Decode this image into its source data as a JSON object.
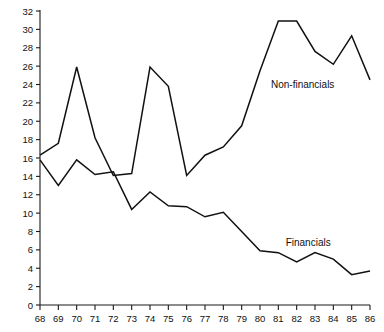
{
  "chart_data": {
    "type": "line",
    "title": "",
    "subtitle": "",
    "xlabel": "",
    "ylabel": "",
    "grid": false,
    "legend_position": "inline-annotation",
    "x": [
      68,
      69,
      70,
      71,
      72,
      73,
      74,
      75,
      76,
      77,
      78,
      79,
      80,
      81,
      82,
      83,
      84,
      85,
      86
    ],
    "categories": [
      "68",
      "69",
      "70",
      "71",
      "72",
      "73",
      "74",
      "75",
      "76",
      "77",
      "78",
      "79",
      "80",
      "81",
      "82",
      "83",
      "84",
      "85",
      "86"
    ],
    "xlim": [
      68,
      86
    ],
    "ylim": [
      0,
      32
    ],
    "ytick_step": 2,
    "yticks": [
      0,
      2,
      4,
      6,
      8,
      10,
      12,
      14,
      16,
      18,
      20,
      22,
      24,
      26,
      28,
      30,
      32
    ],
    "ytick_labels": [
      "0",
      "2",
      "4",
      "6",
      "8",
      "10",
      "12",
      "14",
      "16",
      "18",
      "20",
      "22",
      "24",
      "26",
      "28",
      "30",
      "32"
    ],
    "xticks": [
      68,
      69,
      70,
      71,
      72,
      73,
      74,
      75,
      76,
      77,
      78,
      79,
      80,
      81,
      82,
      83,
      84,
      85,
      86
    ],
    "xtick_labels": [
      "68",
      "69",
      "70",
      "71",
      "72",
      "73",
      "74",
      "75",
      "76",
      "77",
      "78",
      "79",
      "80",
      "81",
      "82",
      "83",
      "84",
      "85",
      "86"
    ],
    "series": [
      {
        "name": "Non-financials",
        "label": "Non-financials",
        "color": "#111111",
        "label_x": 80.6,
        "label_y": 23.6,
        "values": [
          16.3,
          17.6,
          25.9,
          18.2,
          14.1,
          14.3,
          25.9,
          23.8,
          14.1,
          16.3,
          17.2,
          19.5,
          25.5,
          30.9,
          30.9,
          27.6,
          26.2,
          29.3,
          24.5
        ]
      },
      {
        "name": "Financials",
        "label": "Financials",
        "color": "#111111",
        "label_x": 81.4,
        "label_y": 6.4,
        "values": [
          15.8,
          13.0,
          15.8,
          14.2,
          14.5,
          10.4,
          12.3,
          10.8,
          10.7,
          9.6,
          10.1,
          8.0,
          5.9,
          5.7,
          4.7,
          5.7,
          5.0,
          3.3,
          3.7
        ]
      }
    ]
  },
  "axes": {
    "y_axis_name": "value-axis",
    "x_axis_name": "year-axis"
  }
}
